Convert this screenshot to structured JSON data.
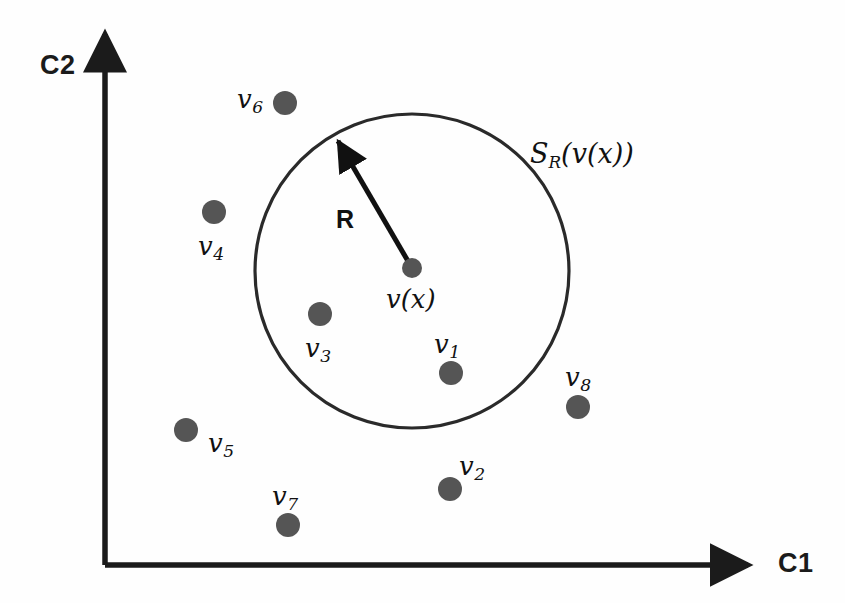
{
  "figure": {
    "background_color": "#fefefe",
    "ink_color": "#1b1b1b",
    "node_color": "#555555",
    "axes": {
      "x_label": "C1",
      "y_label": "C2",
      "origin": {
        "x": 105,
        "y": 565
      },
      "x_end": {
        "x": 755,
        "y": 565
      },
      "y_end": {
        "x": 105,
        "y": 28
      }
    },
    "sphere": {
      "label": "S",
      "label_sub": "R",
      "label_arg": "(v(x))",
      "center": {
        "x": 412,
        "y": 271
      },
      "radius": 157,
      "label_pos": {
        "x": 530,
        "y": 143
      }
    },
    "radius_arrow": {
      "label": "R",
      "from": {
        "x": 412,
        "y": 268
      },
      "to": {
        "x": 333,
        "y": 133
      },
      "label_pos": {
        "x": 336,
        "y": 205
      }
    },
    "center_node": {
      "id": "v(x)",
      "label": "v(x)",
      "x": 412,
      "y": 268,
      "r": 10,
      "label_pos": {
        "x": 386,
        "y": 288
      }
    },
    "nodes": [
      {
        "id": "v6",
        "label": "v",
        "sub": "6",
        "x": 285,
        "y": 103,
        "r": 12,
        "label_pos": {
          "x": 237,
          "y": 88
        },
        "inside_sphere": false
      },
      {
        "id": "v4",
        "label": "v",
        "sub": "4",
        "x": 214,
        "y": 212,
        "r": 12,
        "label_pos": {
          "x": 198,
          "y": 235
        },
        "inside_sphere": false
      },
      {
        "id": "v3",
        "label": "v",
        "sub": "3",
        "x": 320,
        "y": 314,
        "r": 12,
        "label_pos": {
          "x": 305,
          "y": 337
        },
        "inside_sphere": true
      },
      {
        "id": "v1",
        "label": "v",
        "sub": "1",
        "x": 451,
        "y": 373,
        "r": 12,
        "label_pos": {
          "x": 434,
          "y": 333
        },
        "inside_sphere": true
      },
      {
        "id": "v8",
        "label": "v",
        "sub": "8",
        "x": 578,
        "y": 407,
        "r": 12,
        "label_pos": {
          "x": 565,
          "y": 366
        },
        "inside_sphere": false
      },
      {
        "id": "v5",
        "label": "v",
        "sub": "5",
        "x": 186,
        "y": 430,
        "r": 12,
        "label_pos": {
          "x": 208,
          "y": 432
        },
        "inside_sphere": false
      },
      {
        "id": "v2",
        "label": "v",
        "sub": "2",
        "x": 450,
        "y": 489,
        "r": 12,
        "label_pos": {
          "x": 459,
          "y": 455
        },
        "inside_sphere": false
      },
      {
        "id": "v7",
        "label": "v",
        "sub": "7",
        "x": 288,
        "y": 525,
        "r": 12,
        "label_pos": {
          "x": 272,
          "y": 485
        },
        "inside_sphere": false
      }
    ]
  }
}
